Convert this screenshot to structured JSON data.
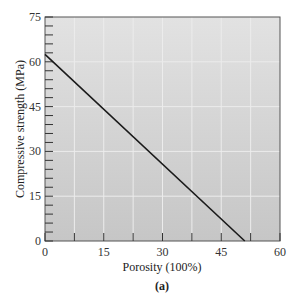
{
  "chart_data": {
    "type": "line",
    "title": "",
    "caption": "(a)",
    "xlabel": "Porosity (100%)",
    "ylabel": "Compressive strength (MPa)",
    "xlim": [
      0,
      60
    ],
    "ylim": [
      0,
      75
    ],
    "x_ticks": [
      0,
      15,
      30,
      45,
      60
    ],
    "y_ticks": [
      0,
      15,
      30,
      45,
      60,
      75
    ],
    "x_minor_step": 7.5,
    "y_minor_step": 3,
    "grid": true,
    "legend": null,
    "series": [
      {
        "name": "Compressive strength vs porosity",
        "x": [
          0,
          51
        ],
        "y": [
          62.5,
          0
        ]
      }
    ]
  },
  "colors": {
    "plot_background": "#cfcfcf",
    "grid": "#ececec",
    "line": "#1a1a1a",
    "frame": "#555555"
  }
}
